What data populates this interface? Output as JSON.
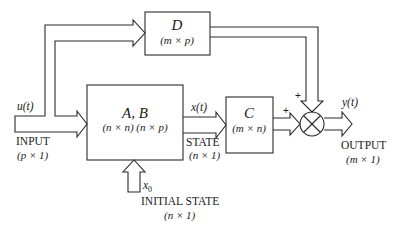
{
  "diagram": {
    "type": "state-space block diagram",
    "colors": {
      "stroke": "#2a2a2a",
      "text": "#1a1a1a",
      "background": "#ffffff"
    },
    "blocks": {
      "ab": {
        "name": "A, B",
        "dims": "(n × n) (n × p)"
      },
      "c": {
        "name": "C",
        "dims": "(m × n)"
      },
      "d": {
        "name": "D",
        "dims": "(m × p)"
      }
    },
    "summing_junction": {
      "signs": [
        "+",
        "+"
      ]
    },
    "signals": {
      "input": {
        "symbol": "u(t)",
        "label": "INPUT",
        "dims": "(p × 1)"
      },
      "state": {
        "symbol": "x(t)",
        "label": "STATE",
        "dims": "(n × 1)"
      },
      "output": {
        "symbol": "y(t)",
        "label": "OUTPUT",
        "dims": "(m × 1)"
      },
      "initial_state": {
        "symbol": "x0",
        "symbol_base": "x",
        "symbol_sub": "0",
        "label": "INITIAL STATE",
        "dims": "(n × 1)"
      }
    }
  }
}
